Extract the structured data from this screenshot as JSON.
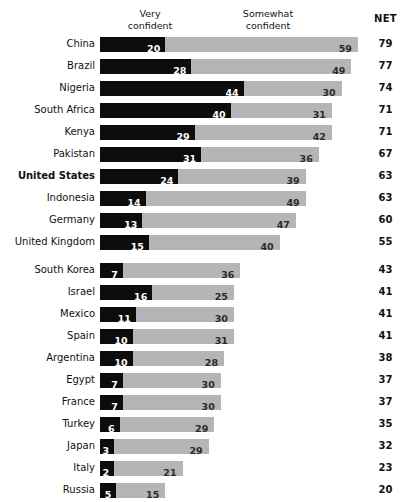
{
  "header": {
    "legend": [
      {
        "label": "Very\nconfident",
        "name": "legend-very-confident"
      },
      {
        "label": "Somewhat\nconfident",
        "name": "legend-somewhat-confident"
      }
    ],
    "net_label": "NET"
  },
  "colors": {
    "very_confident": "#0d0d0d",
    "somewhat_confident": "#b5b5b5",
    "background": "#ffffff",
    "text": "#111111"
  },
  "chart_data": {
    "type": "bar",
    "title": "",
    "subtitle": "",
    "xlabel": "",
    "ylabel": "",
    "orientation": "horizontal",
    "stacked": true,
    "grid": false,
    "legend_position": "top",
    "xlim": [
      0,
      79
    ],
    "units": "percent",
    "series": [
      {
        "name": "Very confident",
        "color": "#0d0d0d",
        "values": [
          20,
          28,
          44,
          40,
          29,
          31,
          24,
          14,
          13,
          15,
          7,
          16,
          11,
          10,
          10,
          7,
          7,
          6,
          3,
          2,
          5
        ]
      },
      {
        "name": "Somewhat confident",
        "color": "#b5b5b5",
        "values": [
          59,
          49,
          30,
          31,
          42,
          36,
          39,
          49,
          47,
          40,
          36,
          25,
          30,
          31,
          28,
          30,
          30,
          29,
          29,
          21,
          15
        ]
      }
    ],
    "categories": [
      "China",
      "Brazil",
      "Nigeria",
      "South Africa",
      "Kenya",
      "Pakistan",
      "United States",
      "Indonesia",
      "Germany",
      "United Kingdom",
      "South Korea",
      "Israel",
      "Mexico",
      "Spain",
      "Argentina",
      "Egypt",
      "France",
      "Turkey",
      "Japan",
      "Italy",
      "Russia"
    ],
    "net": [
      79,
      77,
      74,
      71,
      71,
      67,
      63,
      63,
      60,
      55,
      43,
      41,
      41,
      41,
      38,
      37,
      37,
      35,
      32,
      23,
      20
    ],
    "highlight_category": "United States",
    "group_break_after": "United Kingdom"
  }
}
